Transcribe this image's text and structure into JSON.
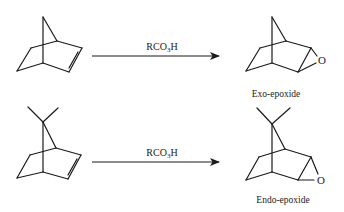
{
  "diagram": {
    "type": "chemical-reaction-scheme",
    "reactions": [
      {
        "reactant": "norbornene",
        "reagent": {
          "prefix": "RCO",
          "subscript": "3",
          "suffix": "H"
        },
        "product": {
          "label": "Exo-epoxide",
          "heteroatom": "O"
        }
      },
      {
        "reactant": "7,7-dimethylnorbornene",
        "reagent": {
          "prefix": "RCO",
          "subscript": "3",
          "suffix": "H"
        },
        "product": {
          "label": "Endo-epoxide",
          "heteroatom": "O"
        }
      }
    ],
    "colors": {
      "ink": "#1a1a1a",
      "background": "#ffffff"
    }
  }
}
